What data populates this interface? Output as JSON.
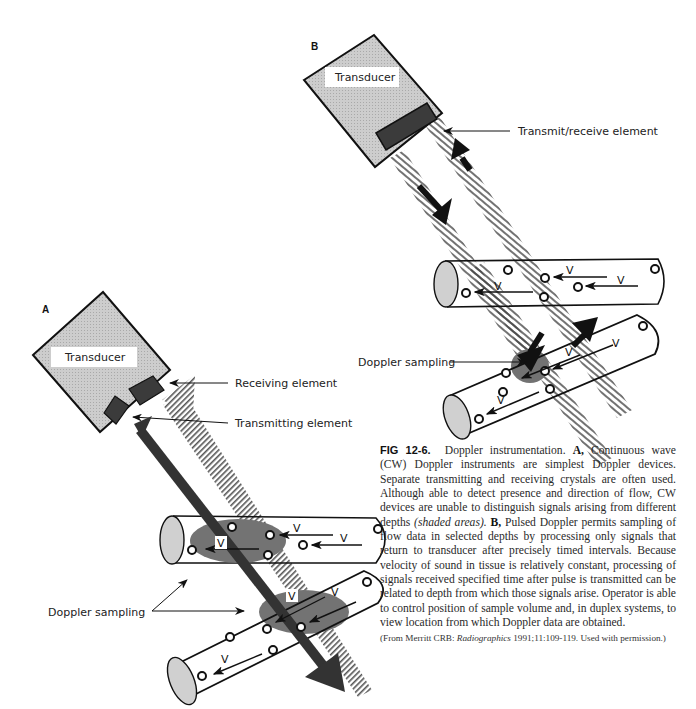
{
  "figure": {
    "panel_a": {
      "label": "A",
      "transducer_label": "Transducer",
      "callouts": {
        "receiving": "Receiving element",
        "transmitting": "Transmitting element",
        "doppler_sampling": "Doppler sampling"
      },
      "velocity_label": "V"
    },
    "panel_b": {
      "label": "B",
      "transducer_label": "Transducer",
      "callouts": {
        "transmit_receive": "Transmit/receive element",
        "doppler_sampling": "Doppler sampling"
      },
      "velocity_label": "V"
    },
    "colors": {
      "transducer_fill": "#c8c8c8",
      "element_fill": "#3a3a3a",
      "sample_volume": "#6e6e6e",
      "beam_dark": "#333333",
      "vessel_end": "#cfcfcf"
    }
  },
  "caption": {
    "fig_number": "FIG 12-6.",
    "title": "Doppler instrumentation.",
    "a_label": "A,",
    "a_text_1": "Continuous wave (CW) Doppler instruments are simplest Doppler devices. Separate transmitting and receiving crystals are often used. Although able to detect presence and direction of flow, CW devices are unable to distinguish signals arising from different depths",
    "a_italic": "(shaded areas).",
    "b_label": "B,",
    "b_text": "Pulsed Doppler permits sampling of flow data in selected depths by processing only signals that return to transducer after precisely timed intervals. Because velocity of sound in tissue is relatively constant, processing of signals received specified time after pulse is transmitted can be related to depth from which those signals arise. Operator is able to control position of sample volume and, in duplex systems, to view location from which Doppler data are obtained.",
    "credit_prefix": "(From Merritt CRB: ",
    "credit_journal": "Radiographics",
    "credit_suffix": " 1991;11:109-119. Used with permission.)"
  }
}
